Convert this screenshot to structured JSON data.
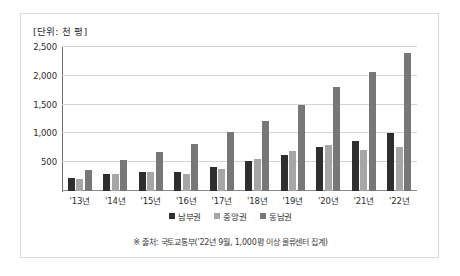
{
  "figure": {
    "unit_label": "[단위: 천 평]",
    "footnote": "※ 출처: 국토교통부('22년 9월, 1,000평 이상 물류센터 집계)"
  },
  "chart_data": {
    "type": "bar",
    "title": "",
    "subtitle": "",
    "xlabel": "",
    "ylabel": "",
    "unit": "천 평",
    "ylim": [
      0,
      2500
    ],
    "yticks": [
      0,
      500,
      1000,
      1500,
      2000,
      2500
    ],
    "ytick_labels": [
      "",
      "500",
      "1,000",
      "1,500",
      "2,000",
      "2,500"
    ],
    "grid": true,
    "legend_position": "bottom",
    "categories": [
      "'13년",
      "'14년",
      "'15년",
      "'16년",
      "'17년",
      "'18년",
      "'19년",
      "'20년",
      "'21년",
      "'22년"
    ],
    "series": [
      {
        "name": "남부권",
        "color": "#2e2e2e",
        "values": [
          230,
          290,
          330,
          330,
          420,
          520,
          620,
          760,
          860,
          1010
        ]
      },
      {
        "name": "중앙권",
        "color": "#a6a6a6",
        "values": [
          200,
          290,
          330,
          300,
          390,
          560,
          690,
          800,
          720,
          760
        ]
      },
      {
        "name": "동남권",
        "color": "#777777",
        "values": [
          370,
          540,
          670,
          810,
          1030,
          1220,
          1500,
          1800,
          2070,
          2400
        ]
      }
    ]
  }
}
